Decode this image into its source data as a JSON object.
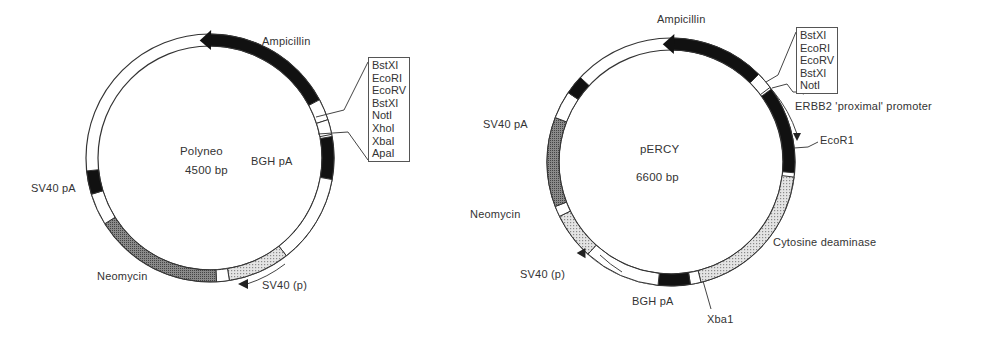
{
  "colors": {
    "solid": "#111111",
    "neo": "#6e6e6e",
    "dotted": "#c8c8c8",
    "empty": "#ffffff",
    "stroke": "#333333"
  },
  "plasmids": [
    {
      "name": "Polyneo",
      "size": "4500 bp",
      "center": [
        210,
        158
      ],
      "r_outer": 124,
      "r_inner": 112,
      "segments": [
        {
          "feature": "Ampicillin",
          "start": -5,
          "end": 62,
          "fill": "solid",
          "arrow": "ccw"
        },
        {
          "feature": "spacer",
          "start": 62,
          "end": 72,
          "fill": "empty"
        },
        {
          "feature": "MCS",
          "start": 72,
          "end": 79,
          "fill": "empty"
        },
        {
          "feature": "BGH pA",
          "start": 80,
          "end": 100,
          "fill": "solid"
        },
        {
          "feature": "spacer",
          "start": 100,
          "end": 142,
          "fill": "empty"
        },
        {
          "feature": "SV40 (p)",
          "start": 142,
          "end": 171,
          "fill": "dotted"
        },
        {
          "feature": "spacer",
          "start": 171,
          "end": 177,
          "fill": "empty"
        },
        {
          "feature": "Neomycin",
          "start": 177,
          "end": 238,
          "fill": "neo"
        },
        {
          "feature": "spacer",
          "start": 238,
          "end": 253,
          "fill": "empty"
        },
        {
          "feature": "SV40 pA",
          "start": 253,
          "end": 264,
          "fill": "solid"
        }
      ],
      "labels": {
        "ampicillin": "Ampicillin",
        "bgh": "BGH pA",
        "sv40p": "SV40 (p)",
        "neomycin": "Neomycin",
        "sv40pa": "SV40 pA"
      },
      "sites": [
        "BstXI",
        "EcoRI",
        "EcoRV",
        "BstXI",
        "NotI",
        "XhoI",
        "XbaI",
        "ApaI"
      ]
    },
    {
      "name": "pERCY",
      "size": "6600 bp",
      "center": [
        671,
        162
      ],
      "r_outer": 124,
      "r_inner": 112,
      "segments": [
        {
          "feature": "Ampicillin",
          "start": -4,
          "end": 45,
          "fill": "solid",
          "arrow": "ccw"
        },
        {
          "feature": "MCS",
          "start": 45,
          "end": 53,
          "fill": "empty"
        },
        {
          "feature": "ERBB2 'proximal' promoter",
          "start": 54,
          "end": 95,
          "fill": "solid"
        },
        {
          "feature": "Cytosine deaminase",
          "start": 97,
          "end": 166,
          "fill": "dotted"
        },
        {
          "feature": "spacer",
          "start": 166,
          "end": 171,
          "fill": "empty"
        },
        {
          "feature": "BGH pA",
          "start": 171,
          "end": 186,
          "fill": "solid"
        },
        {
          "feature": "spacer",
          "start": 186,
          "end": 222,
          "fill": "empty"
        },
        {
          "feature": "SV40 (p)",
          "start": 222,
          "end": 244,
          "fill": "dotted"
        },
        {
          "feature": "spacer",
          "start": 244,
          "end": 249,
          "fill": "empty"
        },
        {
          "feature": "Neomycin",
          "start": 249,
          "end": 291,
          "fill": "neo"
        },
        {
          "feature": "spacer",
          "start": 291,
          "end": 304,
          "fill": "empty"
        },
        {
          "feature": "SV40 pA",
          "start": 304,
          "end": 313,
          "fill": "solid"
        }
      ],
      "labels": {
        "ampicillin": "Ampicillin",
        "erbb2": "ERBB2 'proximal' promoter",
        "ecor1": "EcoR1",
        "cd": "Cytosine deaminase",
        "xba1": "Xba1",
        "bgh": "BGH pA",
        "sv40p": "SV40 (p)",
        "neomycin": "Neomycin",
        "sv40pa": "SV40 pA"
      },
      "sites": [
        "BstXI",
        "EcoRI",
        "EcoRV",
        "BstXI",
        "NotI"
      ]
    }
  ]
}
